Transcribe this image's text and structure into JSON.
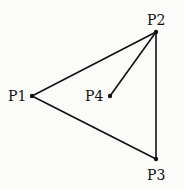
{
  "diagram": {
    "type": "graph",
    "points": [
      {
        "id": "P1",
        "label": "P1",
        "x": 32,
        "y": 96,
        "label_x": 8,
        "label_y": 101,
        "anchor": "start"
      },
      {
        "id": "P2",
        "label": "P2",
        "x": 156,
        "y": 32,
        "label_x": 147,
        "label_y": 25,
        "anchor": "start"
      },
      {
        "id": "P3",
        "label": "P3",
        "x": 156,
        "y": 159,
        "label_x": 147,
        "label_y": 180,
        "anchor": "start"
      },
      {
        "id": "P4",
        "label": "P4",
        "x": 110,
        "y": 96,
        "label_x": 85,
        "label_y": 101,
        "anchor": "start"
      }
    ],
    "edges": [
      {
        "from": "P1",
        "to": "P2"
      },
      {
        "from": "P1",
        "to": "P3"
      },
      {
        "from": "P2",
        "to": "P3"
      },
      {
        "from": "P2",
        "to": "P4"
      }
    ],
    "line_color": "#111111",
    "point_color": "#111111"
  }
}
